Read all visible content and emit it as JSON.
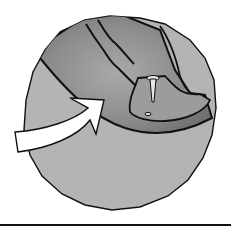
{
  "illustration": {
    "subject": "magnified circle showing a finger segment with a small pin inserted, arrow pointing to the area",
    "colors": {
      "background": "#ffffff",
      "circle_fill": "#b4b4b4",
      "finger_fill": "#8e8e8e",
      "finger_shadow": "#6f6f6f",
      "outline": "#111111",
      "arrow_fill": "#ffffff",
      "pin_fill": "#e6e6e6"
    }
  }
}
